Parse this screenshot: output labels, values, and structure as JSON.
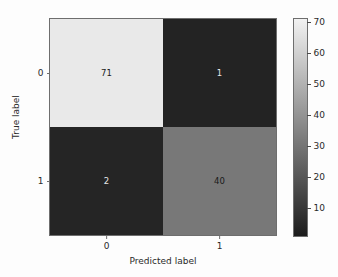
{
  "chart_data": {
    "type": "heatmap",
    "title": "",
    "xlabel": "Predicted label",
    "ylabel": "True label",
    "xticklabels": [
      "0",
      "1"
    ],
    "yticklabels": [
      "0",
      "1"
    ],
    "categories_x": [
      "0",
      "1"
    ],
    "categories_y": [
      "0",
      "1"
    ],
    "matrix": [
      [
        71,
        1
      ],
      [
        2,
        40
      ]
    ],
    "cells": [
      {
        "row": 0,
        "col": 0,
        "value": "71",
        "fill": "#e9e9e9",
        "text_color": "#1a1a1a"
      },
      {
        "row": 0,
        "col": 1,
        "value": "1",
        "fill": "#232323",
        "text_color": "#e8e8e8"
      },
      {
        "row": 1,
        "col": 0,
        "value": "2",
        "fill": "#252525",
        "text_color": "#e8e8e8"
      },
      {
        "row": 1,
        "col": 1,
        "value": "40",
        "fill": "#787878",
        "text_color": "#1a1a1a"
      }
    ],
    "colormap": "gray",
    "colorbar": {
      "ticks": [
        "70",
        "60",
        "50",
        "40",
        "30",
        "20",
        "10"
      ],
      "tick_values": [
        70,
        60,
        50,
        40,
        30,
        20,
        10
      ],
      "vmin": 1,
      "vmax": 71,
      "top_color": "#f2f2f2",
      "bottom_color": "#1c1c1c",
      "orientation": "vertical"
    },
    "grid": false,
    "legend": null,
    "axis_color": "#6e6e6e",
    "background": "#fdfdfd"
  }
}
